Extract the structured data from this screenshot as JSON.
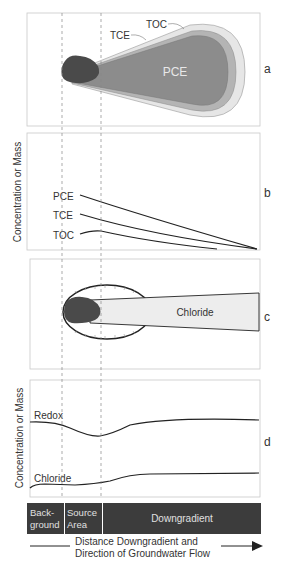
{
  "panels": {
    "a": {
      "letter": "a",
      "labels": {
        "pce": "PCE",
        "tce": "TCE",
        "toc": "TOC"
      }
    },
    "b": {
      "letter": "b",
      "ylabel": "Concentration or Mass",
      "series": [
        {
          "name": "PCE",
          "label": "PCE"
        },
        {
          "name": "TCE",
          "label": "TCE"
        },
        {
          "name": "TOC",
          "label": "TOC"
        }
      ]
    },
    "c": {
      "letter": "c",
      "labels": {
        "chloride": "Chloride"
      }
    },
    "d": {
      "letter": "d",
      "ylabel": "Concentration or Mass",
      "series": [
        {
          "name": "Redox",
          "label": "Redox"
        },
        {
          "name": "Chloride",
          "label": "Chloride"
        }
      ]
    }
  },
  "zones": {
    "background_line1": "Back-",
    "background_line2": "ground",
    "source_line1": "Source",
    "source_line2": "Area",
    "downgradient": "Downgradient"
  },
  "axis": {
    "line1": "Distance Downgradient and",
    "line2": "Direction of Groundwater Flow"
  },
  "colors": {
    "source": "#4a4a4a",
    "pce": "#8c8c8c",
    "tce": "#b4b4b4",
    "toc": "#e6e6e6",
    "chloride_plume": "#ededed",
    "zone_bar": "#3c3c3c",
    "frame": "#c8c8c8",
    "curve": "#222222"
  }
}
